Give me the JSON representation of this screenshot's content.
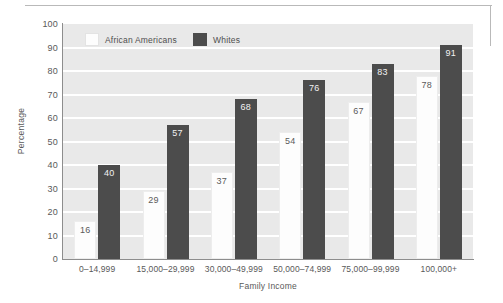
{
  "chart_data": {
    "type": "bar",
    "title": "",
    "xlabel": "Family Income",
    "ylabel": "Percentage",
    "ylim": [
      0,
      100
    ],
    "ytick_labels": [
      "100",
      "90",
      "80",
      "70",
      "60",
      "50",
      "40",
      "30",
      "20",
      "10",
      "0"
    ],
    "grid": true,
    "legend_position": "top-left-inside",
    "categories": [
      "0–14,999",
      "15,000–29,999",
      "30,000–49,999",
      "50,000–74,999",
      "75,000–99,999",
      "100,000+"
    ],
    "series": [
      {
        "name": "African Americans",
        "color": "#fdfdfd",
        "values": [
          16,
          29,
          37,
          54,
          67,
          78
        ]
      },
      {
        "name": "Whites",
        "color": "#4c4c4c",
        "values": [
          40,
          57,
          68,
          76,
          83,
          91
        ]
      }
    ]
  },
  "legend": {
    "item1": "African Americans",
    "item2": "Whites"
  }
}
